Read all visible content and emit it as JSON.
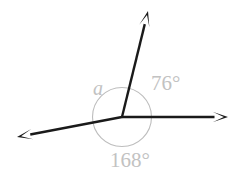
{
  "diagram": {
    "type": "angle-diagram",
    "background_color": "#ffffff",
    "stroke_color": "#1a1a1a",
    "label_color": "#c2c2c2",
    "circle_color": "#bdbdbd",
    "vertex": {
      "x": 122,
      "y": 117
    },
    "circle": {
      "cx": 122,
      "cy": 117,
      "r": 29.5
    },
    "rays": [
      {
        "name": "ray-up-right",
        "from": {
          "x": 122,
          "y": 117
        },
        "to": {
          "x": 148,
          "y": 11
        },
        "arrow": "end",
        "direction_degrees": 76
      },
      {
        "name": "ray-right",
        "from": {
          "x": 122,
          "y": 117
        },
        "to": {
          "x": 228,
          "y": 117
        },
        "arrow": "end",
        "direction_degrees": 0
      },
      {
        "name": "ray-left-down",
        "from": {
          "x": 122,
          "y": 117
        },
        "to": {
          "x": 17,
          "y": 137
        },
        "arrow": "end",
        "direction_degrees": 191
      }
    ],
    "labels": [
      {
        "name": "angle-label-a",
        "text": "a",
        "x": 93,
        "y": 95,
        "style": "italic",
        "meaning": "unknown-angle"
      },
      {
        "name": "angle-label-76",
        "text": "76°",
        "x": 151,
        "y": 90,
        "style": "normal",
        "meaning": "angle-between-right-ray-and-upper-ray"
      },
      {
        "name": "angle-label-168",
        "text": "168°",
        "x": 110,
        "y": 167,
        "style": "normal",
        "meaning": "reflex-measured-angle-below"
      }
    ]
  }
}
